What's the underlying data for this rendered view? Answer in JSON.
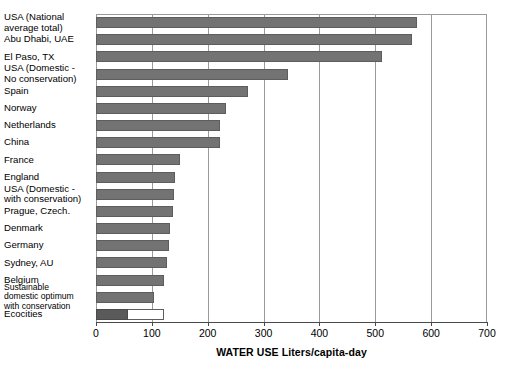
{
  "chart_data": {
    "type": "bar",
    "orientation": "horizontal",
    "title": "",
    "xlabel": "WATER USE Liters/capita-day",
    "ylabel": "",
    "xlim": [
      0,
      700
    ],
    "xticks": [
      0,
      100,
      200,
      300,
      400,
      500,
      600,
      700
    ],
    "grid": true,
    "legend": false,
    "categories": [
      "USA (National average total)",
      "Abu Dhabi, UAE",
      "El Paso, TX",
      "USA (Domestic - No conservation)",
      "Spain",
      "Norway",
      "Netherlands",
      "China",
      "France",
      "England",
      "USA (Domestic - with conservation)",
      "Prague, Czech.",
      "Denmark",
      "Germany",
      "Sydney, AU",
      "Belgium",
      "Sustainable domestic optimum with conservation",
      "Ecocities"
    ],
    "values": [
      575,
      565,
      512,
      343,
      273,
      232,
      222,
      222,
      150,
      142,
      140,
      137,
      132,
      130,
      127,
      122,
      104,
      122
    ],
    "bars": [
      {
        "label": "USA (National average total)",
        "label_lines": [
          "USA (National",
          "average total)"
        ],
        "value": 575,
        "style": "filled",
        "small_label": false
      },
      {
        "label": "Abu Dhabi, UAE",
        "label_lines": [
          "Abu Dhabi, UAE"
        ],
        "value": 565,
        "style": "filled",
        "small_label": false
      },
      {
        "label": "El Paso, TX",
        "label_lines": [
          "El Paso, TX"
        ],
        "value": 512,
        "style": "filled",
        "small_label": false
      },
      {
        "label": "USA (Domestic - No conservation)",
        "label_lines": [
          "USA (Domestic -",
          "No conservation)"
        ],
        "value": 343,
        "style": "filled",
        "small_label": false
      },
      {
        "label": "Spain",
        "label_lines": [
          "Spain"
        ],
        "value": 273,
        "style": "filled",
        "small_label": false
      },
      {
        "label": "Norway",
        "label_lines": [
          "Norway"
        ],
        "value": 232,
        "style": "filled",
        "small_label": false
      },
      {
        "label": "Netherlands",
        "label_lines": [
          "Netherlands"
        ],
        "value": 222,
        "style": "filled",
        "small_label": false
      },
      {
        "label": "China",
        "label_lines": [
          "China"
        ],
        "value": 222,
        "style": "filled",
        "small_label": false
      },
      {
        "label": "France",
        "label_lines": [
          "France"
        ],
        "value": 150,
        "style": "filled",
        "small_label": false
      },
      {
        "label": "England",
        "label_lines": [
          "England"
        ],
        "value": 142,
        "style": "filled",
        "small_label": false
      },
      {
        "label": "USA (Domestic - with conservation)",
        "label_lines": [
          "USA (Domestic -",
          "with conservation)"
        ],
        "value": 140,
        "style": "filled",
        "small_label": false
      },
      {
        "label": "Prague, Czech.",
        "label_lines": [
          "Prague, Czech."
        ],
        "value": 137,
        "style": "filled",
        "small_label": false
      },
      {
        "label": "Denmark",
        "label_lines": [
          "Denmark"
        ],
        "value": 132,
        "style": "filled",
        "small_label": false
      },
      {
        "label": "Germany",
        "label_lines": [
          "Germany"
        ],
        "value": 130,
        "style": "filled",
        "small_label": false
      },
      {
        "label": "Sydney, AU",
        "label_lines": [
          "Sydney, AU"
        ],
        "value": 127,
        "style": "filled",
        "small_label": false
      },
      {
        "label": "Belgium",
        "label_lines": [
          "Belgium"
        ],
        "value": 122,
        "style": "filled",
        "small_label": false
      },
      {
        "label": "Sustainable domestic optimum with conservation",
        "label_lines": [
          "Sustainable",
          "domestic optimum",
          "with conservation"
        ],
        "value": 104,
        "style": "filled",
        "small_label": true
      },
      {
        "label": "Ecocities",
        "label_lines": [
          "Ecocities"
        ],
        "value": 122,
        "style": "outline",
        "segment_value": 58,
        "small_label": false
      }
    ],
    "colors": {
      "bar_fill": "#737373",
      "bar_segment_fill": "#5a5a5a",
      "bar_outline": "#5d5d5d",
      "grid": "#9a9a9a",
      "axis": "#4a4a4a",
      "background": "#ffffff",
      "text": "#000000"
    }
  }
}
